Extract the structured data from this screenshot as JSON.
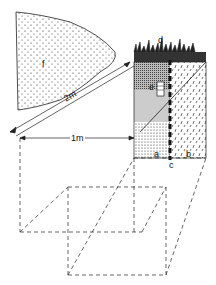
{
  "diagram": {
    "type": "soil-sampling-plot",
    "labels": {
      "a": "a",
      "b": "b",
      "c": "c",
      "d": "d",
      "e": "e",
      "f": "f"
    },
    "dimensions": {
      "width_label": "1m",
      "diagonal_label": "2m"
    },
    "colors": {
      "ink": "#111111",
      "background": "#ffffff"
    }
  }
}
